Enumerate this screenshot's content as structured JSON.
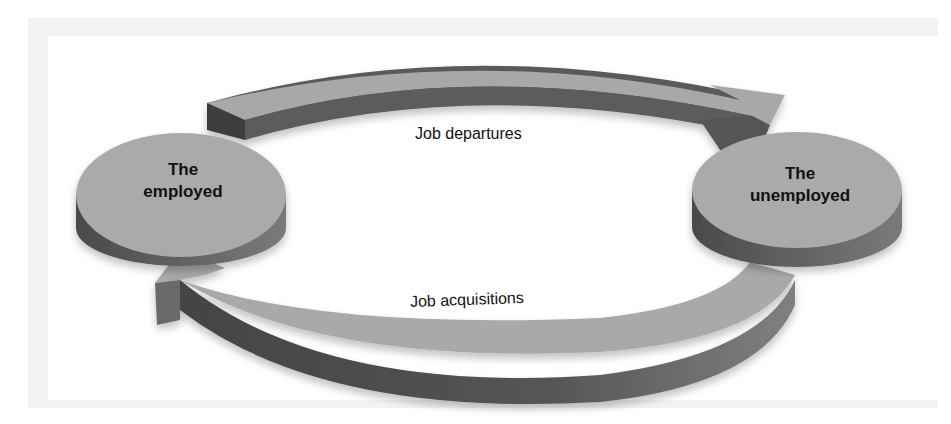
{
  "diagram": {
    "type": "flow-cycle",
    "nodes": [
      {
        "id": "employed",
        "label_line1": "The",
        "label_line2": "employed"
      },
      {
        "id": "unemployed",
        "label_line1": "The",
        "label_line2": "unemployed"
      }
    ],
    "edges": [
      {
        "from": "employed",
        "to": "unemployed",
        "label": "Job departures"
      },
      {
        "from": "unemployed",
        "to": "employed",
        "label": "Job acquisitions"
      }
    ],
    "colors": {
      "top": "#a9a9a9",
      "side_dark": "#4e4e4e",
      "side_mid": "#6e6e6e",
      "background": "#ffffff",
      "frame": "#f3f3f3"
    }
  }
}
